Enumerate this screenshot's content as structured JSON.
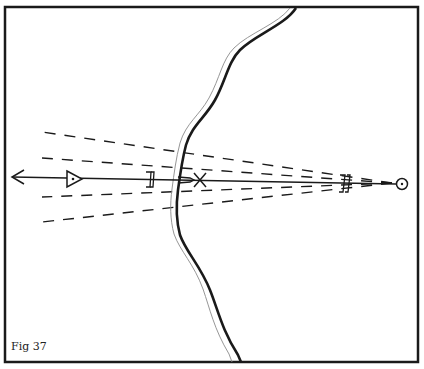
{
  "figure": {
    "label": "Fig 37",
    "frame": {
      "x": 5,
      "y": 7,
      "width": 413,
      "height": 355,
      "stroke": "#1a1a1a"
    },
    "colors": {
      "ink": "#1a1a1a",
      "background": "#ffffff",
      "river_light": "#8a8a8a"
    }
  },
  "elements": {
    "river": {
      "type": "double-line-river",
      "description": "winding river from top center to bottom center"
    },
    "sight_line": {
      "from": [
        398,
        184
      ],
      "to": [
        12,
        178
      ],
      "arrowhead": "left"
    },
    "dashed_lines": [
      {
        "from": [
          398,
          184
        ],
        "to": [
          42,
          132
        ]
      },
      {
        "from": [
          398,
          184
        ],
        "to": [
          42,
          158
        ]
      },
      {
        "from": [
          398,
          184
        ],
        "to": [
          42,
          197
        ]
      },
      {
        "from": [
          398,
          184
        ],
        "to": [
          42,
          222
        ]
      }
    ],
    "markers": [
      {
        "name": "observer-circle",
        "symbol": "circle-dot",
        "x": 402,
        "y": 184
      },
      {
        "name": "bracket-far",
        "symbol": "double-bracket",
        "x": 345,
        "y": 183
      },
      {
        "name": "bracket-near",
        "symbol": "double-bracket",
        "x": 150,
        "y": 180
      },
      {
        "name": "cross-mark",
        "symbol": "x",
        "x": 200,
        "y": 180
      },
      {
        "name": "triangle-mark",
        "symbol": "triangle-dot",
        "x": 74,
        "y": 179
      },
      {
        "name": "small-arrow",
        "symbol": "arrow-right",
        "x": 182,
        "y": 180
      }
    ]
  }
}
